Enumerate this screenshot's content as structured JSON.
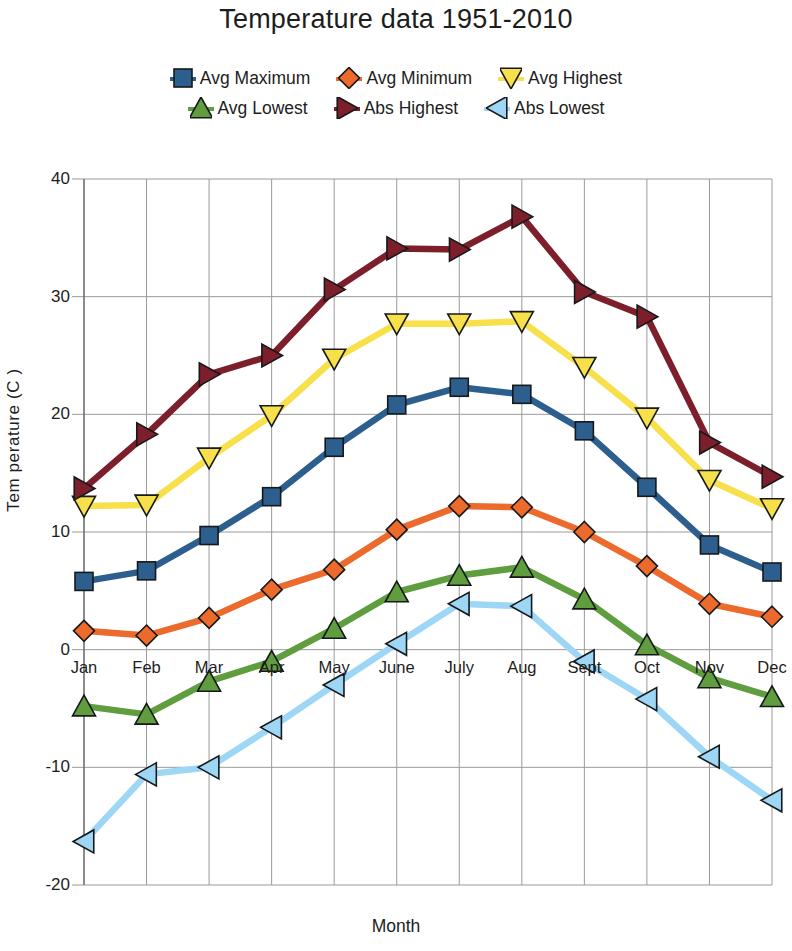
{
  "chart_data": {
    "type": "line",
    "title": "Temperature data 1951-2010",
    "xlabel": "Month",
    "ylabel": "Tem perature (C )",
    "categories": [
      "Jan",
      "Feb",
      "Mar",
      "Apr",
      "May",
      "June",
      "July",
      "Aug",
      "Sept",
      "Oct",
      "Nov",
      "Dec"
    ],
    "ylim": [
      -20,
      40
    ],
    "ytick_values": [
      40,
      30,
      20,
      10,
      0,
      -10,
      -20
    ],
    "ytick_labels": [
      "40",
      "30",
      "20",
      "10",
      "0",
      "-10",
      "-20"
    ],
    "grid": true,
    "legend_position": "top",
    "series": [
      {
        "name": "Avg Maximum",
        "color": "#2d5f8e",
        "marker": "square",
        "values": [
          5.8,
          6.7,
          9.7,
          13.0,
          17.2,
          20.8,
          22.3,
          21.7,
          18.6,
          13.8,
          8.9,
          6.6
        ]
      },
      {
        "name": "Avg Minimum",
        "color": "#ec6a2c",
        "marker": "diamond",
        "values": [
          1.6,
          1.2,
          2.7,
          5.1,
          6.8,
          10.2,
          12.2,
          12.1,
          10.0,
          7.1,
          3.9,
          2.8
        ]
      },
      {
        "name": "Avg Highest",
        "color": "#f7e04a",
        "marker": "triangle-down",
        "values": [
          12.2,
          12.3,
          16.3,
          19.9,
          24.7,
          27.7,
          27.7,
          27.9,
          24.0,
          19.7,
          14.4,
          12.0
        ]
      },
      {
        "name": "Avg Lowest",
        "color": "#5f9d3f",
        "marker": "triangle-up",
        "values": [
          -4.8,
          -5.5,
          -2.7,
          -1.0,
          1.8,
          4.9,
          6.3,
          7.0,
          4.3,
          0.4,
          -2.4,
          -4.0
        ]
      },
      {
        "name": "Abs Highest",
        "color": "#7d1f2b",
        "marker": "triangle-right",
        "values": [
          13.7,
          18.3,
          23.4,
          25.0,
          30.6,
          34.1,
          34.0,
          36.8,
          30.4,
          28.3,
          17.6,
          14.7
        ]
      },
      {
        "name": "Abs Lowest",
        "color": "#9ed7f5",
        "marker": "triangle-left",
        "values": [
          -16.3,
          -10.6,
          -10.0,
          -6.6,
          -3.0,
          0.5,
          3.9,
          3.7,
          -1.0,
          -4.2,
          -9.1,
          -12.8
        ]
      }
    ]
  }
}
